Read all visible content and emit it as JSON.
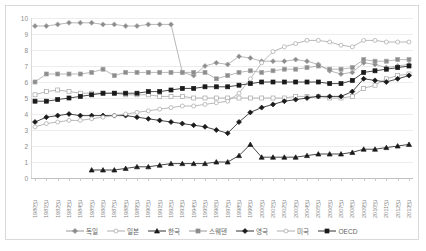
{
  "chart_data": {
    "type": "line",
    "title": "",
    "subtitle": "",
    "xlabel": "",
    "ylabel": "",
    "ylim": [
      0,
      10
    ],
    "ystep": 1,
    "grid": "horizontal",
    "legend_position": "bottom",
    "yticks": [
      "10",
      "9",
      "8",
      "7",
      "6",
      "5",
      "4",
      "3",
      "2",
      "1",
      "0"
    ],
    "categories": [
      "1980년",
      "1981년",
      "1982년",
      "1983년",
      "1984년",
      "1985년",
      "1986년",
      "1987년",
      "1988년",
      "1989년",
      "1990년",
      "1991년",
      "1992년",
      "1993년",
      "1994년",
      "1995년",
      "1996년",
      "1997년",
      "1998년",
      "1999년",
      "2000년",
      "2001년",
      "2002년",
      "2003년",
      "2004년",
      "2005년",
      "2006년",
      "2007년",
      "2008년",
      "2009년",
      "2010년",
      "2011년",
      "2012년",
      "2013년"
    ],
    "series": [
      {
        "name": "독일",
        "marker": "diamond",
        "marker_fill": "#8c8c8c",
        "line_color": "#a6a6a6",
        "values": [
          9.5,
          9.5,
          9.6,
          9.7,
          9.7,
          9.7,
          9.6,
          9.6,
          9.5,
          9.5,
          9.6,
          9.6,
          9.6,
          6.6,
          6.4,
          7.0,
          7.2,
          7.1,
          7.6,
          7.5,
          7.3,
          7.3,
          7.3,
          7.4,
          7.3,
          7.1,
          6.7,
          6.5,
          6.6,
          7.2,
          7.1,
          6.9,
          7.0,
          7.1
        ]
      },
      {
        "name": "일본",
        "marker": "square",
        "marker_fill": "#8c8c8c",
        "line_color": "#a6a6a6",
        "values": [
          6.0,
          6.5,
          6.5,
          6.5,
          6.5,
          6.6,
          6.8,
          6.4,
          6.6,
          6.6,
          6.6,
          6.6,
          6.6,
          6.6,
          6.6,
          6.6,
          6.2,
          6.4,
          6.6,
          6.7,
          6.6,
          6.7,
          6.8,
          6.8,
          6.9,
          7.0,
          6.8,
          6.8,
          6.9,
          7.4,
          7.3,
          7.3,
          7.4,
          7.4
        ]
      },
      {
        "name": "한국",
        "marker": "triangle",
        "marker_fill": "#1a1a1a",
        "line_color": "#1a1a1a",
        "values": [
          null,
          null,
          null,
          null,
          null,
          0.5,
          0.5,
          0.5,
          0.6,
          0.7,
          0.7,
          0.8,
          0.9,
          0.9,
          0.9,
          0.9,
          1.0,
          1.0,
          1.4,
          2.1,
          1.3,
          1.3,
          1.3,
          1.3,
          1.4,
          1.5,
          1.5,
          1.5,
          1.6,
          1.8,
          1.8,
          1.9,
          2.0,
          2.1
        ]
      },
      {
        "name": "스웨덴",
        "marker": "square-open",
        "marker_fill": "#ffffff",
        "line_color": "#a6a6a6",
        "values": [
          5.2,
          5.4,
          5.5,
          5.4,
          5.3,
          5.3,
          5.3,
          5.3,
          5.2,
          5.2,
          5.2,
          5.1,
          5.1,
          5.1,
          5.0,
          5.0,
          5.0,
          5.0,
          5.0,
          5.0,
          5.0,
          5.0,
          5.0,
          5.1,
          5.1,
          5.1,
          5.0,
          5.0,
          5.1,
          5.6,
          5.8,
          6.2,
          6.4,
          6.5
        ]
      },
      {
        "name": "영국",
        "marker": "diamond-filled",
        "marker_fill": "#1a1a1a",
        "line_color": "#1a1a1a",
        "values": [
          3.5,
          3.8,
          3.9,
          4.0,
          3.9,
          3.9,
          3.9,
          3.9,
          3.9,
          3.8,
          3.7,
          3.6,
          3.5,
          3.4,
          3.3,
          3.2,
          3.0,
          2.8,
          3.5,
          4.1,
          4.4,
          4.6,
          4.8,
          4.9,
          5.0,
          5.1,
          5.1,
          5.1,
          5.4,
          6.2,
          6.1,
          6.0,
          6.2,
          6.4
        ]
      },
      {
        "name": "미국",
        "marker": "circle-open",
        "marker_fill": "#ffffff",
        "line_color": "#a6a6a6",
        "values": [
          3.2,
          3.4,
          3.5,
          3.6,
          3.6,
          3.7,
          3.8,
          3.9,
          4.0,
          4.1,
          4.2,
          4.3,
          4.4,
          4.5,
          4.5,
          4.6,
          4.7,
          4.8,
          5.3,
          6.2,
          7.2,
          7.9,
          8.2,
          8.4,
          8.6,
          8.6,
          8.5,
          8.3,
          8.2,
          8.6,
          8.6,
          8.5,
          8.5,
          8.5
        ]
      },
      {
        "name": "OECD",
        "marker": "square-filled",
        "marker_fill": "#1a1a1a",
        "line_color": "#1a1a1a",
        "values": [
          4.8,
          4.8,
          4.9,
          5.0,
          5.1,
          5.2,
          5.3,
          5.3,
          5.3,
          5.3,
          5.4,
          5.4,
          5.5,
          5.6,
          5.6,
          5.7,
          5.7,
          5.7,
          5.8,
          5.9,
          6.0,
          6.0,
          6.0,
          6.0,
          6.0,
          6.0,
          5.9,
          5.9,
          6.1,
          6.6,
          6.7,
          6.8,
          6.9,
          7.0
        ]
      }
    ]
  },
  "legend": {
    "items": [
      {
        "label": "독일",
        "marker": "diamond",
        "color": "#8c8c8c"
      },
      {
        "label": "일본",
        "marker": "circle-open",
        "color": "#a6a6a6"
      },
      {
        "label": "한국",
        "marker": "triangle",
        "color": "#1a1a1a"
      },
      {
        "label": "스웨덴",
        "marker": "square",
        "color": "#8c8c8c"
      },
      {
        "label": "영국",
        "marker": "diamond-filled",
        "color": "#1a1a1a"
      },
      {
        "label": "미국",
        "marker": "circle-open2",
        "color": "#a6a6a6"
      },
      {
        "label": "OECD",
        "marker": "square-filled",
        "color": "#1a1a1a"
      }
    ]
  }
}
